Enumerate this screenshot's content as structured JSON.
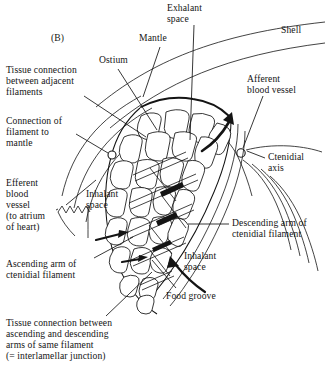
{
  "figure": {
    "panel_label": "(B)",
    "type": "line-diagram"
  },
  "labels": {
    "shell": "Shell",
    "exhalant_space": "Exhalant\nspace",
    "mantle": "Mantle",
    "ostium": "Ostium",
    "afferent_blood_vessel": "Afferent\nblood vessel",
    "ctenidial_axis": "Ctenidial\naxis",
    "tissue_connection_adjacent": "Tissue connection\nbetween adjacent\nfilaments",
    "connection_filament_mantle": "Connection of\nfilament to\nmantle",
    "efferent_blood_vessel": "Efferent\nblood\nvessel\n(to atrium\nof heart)",
    "inhalant_space_upper": "Inhalant\nspace",
    "descending_arm": "Descending arm of\nctenidial filament",
    "inhalant_space_lower": "Inhalant\nspace",
    "ascending_arm": "Ascending arm of\nctenidial filament",
    "food_groove": "Food groove",
    "interlamellar_junction": "Tissue connection between\nascending and descending\narms of same filament\n(= interlamellar junction)"
  },
  "colors": {
    "ink": "#141414",
    "background": "#ffffff"
  }
}
